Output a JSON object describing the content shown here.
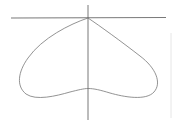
{
  "diagram": {
    "type": "polar-curve",
    "colors": {
      "axis": "#555555",
      "curve": "#777777",
      "edge_line": "#e6e6e6",
      "background": "#ffffff"
    }
  }
}
